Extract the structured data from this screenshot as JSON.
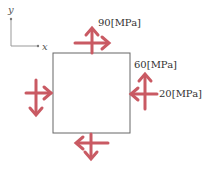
{
  "axes": {
    "x_label": "x",
    "y_label": "y"
  },
  "stresses": {
    "normal_y": "90[MPa]",
    "shear": "60[MPa]",
    "normal_x": "20[MPa]"
  },
  "colors": {
    "arrow": "#c95a63",
    "element": "#666666",
    "axis": "#888888"
  }
}
